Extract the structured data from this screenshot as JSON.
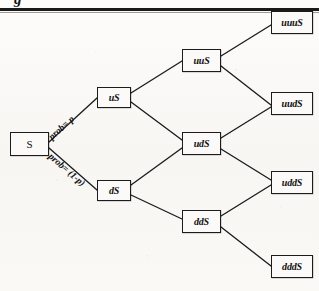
{
  "page": {
    "title_fragment": "g",
    "background_color": "#fbfaf8",
    "ink_color": "#1c1c1c",
    "width": 319,
    "height": 291
  },
  "diagram": {
    "type": "binomial-tree",
    "nodes": [
      {
        "id": "S",
        "label": "S",
        "step": 0,
        "x": 10,
        "y": 132,
        "w": 39,
        "h": 24,
        "font_size": 11
      },
      {
        "id": "uS",
        "label": "uS",
        "step": 1,
        "x": 97,
        "y": 87,
        "w": 34,
        "h": 21,
        "font_size": 10
      },
      {
        "id": "dS",
        "label": "dS",
        "step": 1,
        "x": 97,
        "y": 180,
        "w": 34,
        "h": 21,
        "font_size": 10
      },
      {
        "id": "uuS",
        "label": "uuS",
        "step": 2,
        "x": 182,
        "y": 49,
        "w": 39,
        "h": 23,
        "font_size": 10
      },
      {
        "id": "udS",
        "label": "udS",
        "step": 2,
        "x": 182,
        "y": 132,
        "w": 39,
        "h": 23,
        "font_size": 10
      },
      {
        "id": "ddS",
        "label": "ddS",
        "step": 2,
        "x": 182,
        "y": 210,
        "w": 39,
        "h": 23,
        "font_size": 10
      },
      {
        "id": "uuuS",
        "label": "uuuS",
        "step": 3,
        "x": 271,
        "y": 11,
        "w": 42,
        "h": 23,
        "font_size": 10
      },
      {
        "id": "uudS",
        "label": "uudS",
        "step": 3,
        "x": 271,
        "y": 92,
        "w": 42,
        "h": 23,
        "font_size": 10
      },
      {
        "id": "uddS",
        "label": "uddS",
        "step": 3,
        "x": 271,
        "y": 171,
        "w": 42,
        "h": 23,
        "font_size": 10
      },
      {
        "id": "dddS",
        "label": "dddS",
        "step": 3,
        "x": 271,
        "y": 255,
        "w": 42,
        "h": 23,
        "font_size": 10
      }
    ],
    "edges": [
      {
        "from": "S",
        "to": "uS",
        "x1": 49,
        "y1": 142,
        "x2": 97,
        "y2": 98
      },
      {
        "from": "S",
        "to": "dS",
        "x1": 49,
        "y1": 148,
        "x2": 97,
        "y2": 190
      },
      {
        "from": "uS",
        "to": "uuS",
        "x1": 131,
        "y1": 93,
        "x2": 182,
        "y2": 61
      },
      {
        "from": "uS",
        "to": "udS",
        "x1": 131,
        "y1": 102,
        "x2": 182,
        "y2": 140
      },
      {
        "from": "dS",
        "to": "udS",
        "x1": 131,
        "y1": 185,
        "x2": 182,
        "y2": 148
      },
      {
        "from": "dS",
        "to": "ddS",
        "x1": 131,
        "y1": 195,
        "x2": 182,
        "y2": 219
      },
      {
        "from": "uuS",
        "to": "uuuS",
        "x1": 221,
        "y1": 56,
        "x2": 271,
        "y2": 25
      },
      {
        "from": "uuS",
        "to": "uudS",
        "x1": 221,
        "y1": 66,
        "x2": 271,
        "y2": 105
      },
      {
        "from": "udS",
        "to": "uudS",
        "x1": 221,
        "y1": 138,
        "x2": 271,
        "y2": 107
      },
      {
        "from": "udS",
        "to": "uddS",
        "x1": 221,
        "y1": 149,
        "x2": 271,
        "y2": 180
      },
      {
        "from": "ddS",
        "to": "uddS",
        "x1": 221,
        "y1": 216,
        "x2": 271,
        "y2": 185
      },
      {
        "from": "ddS",
        "to": "dddS",
        "x1": 221,
        "y1": 227,
        "x2": 271,
        "y2": 266
      }
    ],
    "edge_labels": [
      {
        "id": "prob-up",
        "text": "prob= p",
        "x": 50,
        "y": 133,
        "rotate": -42
      },
      {
        "id": "prob-down",
        "text": "prob= (1-p)",
        "x": 50,
        "y": 150,
        "rotate": 41
      }
    ]
  }
}
